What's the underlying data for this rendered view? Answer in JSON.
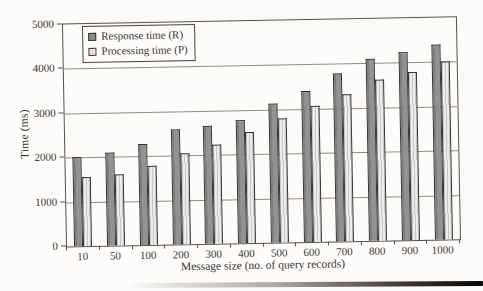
{
  "figure": {
    "background": "#fdfcfa",
    "text_color": "#3b352e",
    "frame_color": "#575149",
    "gridline_color": "#938d84"
  },
  "chart_data": {
    "type": "bar",
    "title": "",
    "xlabel": "Message size (no. of query records)",
    "ylabel": "Time (ms)",
    "categories": [
      "10",
      "50",
      "100",
      "200",
      "300",
      "400",
      "500",
      "600",
      "700",
      "800",
      "900",
      "1000"
    ],
    "series": [
      {
        "name": "Response time (R)",
        "values": [
          2000,
          2100,
          2270,
          2600,
          2660,
          2780,
          3130,
          3400,
          3780,
          4100,
          4230,
          4400
        ],
        "fill": "#8a8a8a",
        "pattern": "solid"
      },
      {
        "name": "Processing time (P)",
        "values": [
          1550,
          1590,
          1780,
          2050,
          2230,
          2500,
          2800,
          3060,
          3300,
          3620,
          3780,
          4000
        ],
        "fill": "#e3e3e3",
        "pattern": "vertical-stripes"
      }
    ],
    "ylim": [
      0,
      5000
    ],
    "y_tick_step": 1000,
    "y_tick_labels": [
      "0",
      "1000",
      "2000",
      "3000",
      "4000",
      "5000"
    ],
    "grid": "horizontal",
    "legend_position": "top-left"
  }
}
